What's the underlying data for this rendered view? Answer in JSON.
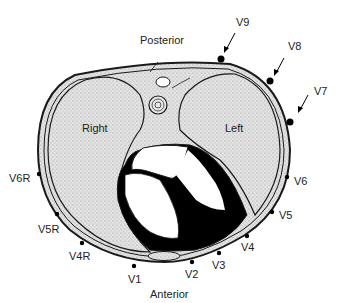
{
  "diagram": {
    "type": "cross-section",
    "orientation": {
      "top": "Posterior",
      "bottom": "Anterior"
    },
    "lungs": {
      "right": "Right",
      "left": "Left"
    },
    "leads": [
      {
        "id": "V1",
        "label": "V1"
      },
      {
        "id": "V2",
        "label": "V2"
      },
      {
        "id": "V3",
        "label": "V3"
      },
      {
        "id": "V4",
        "label": "V4"
      },
      {
        "id": "V5",
        "label": "V5"
      },
      {
        "id": "V6",
        "label": "V6"
      },
      {
        "id": "V7",
        "label": "V7"
      },
      {
        "id": "V8",
        "label": "V8"
      },
      {
        "id": "V9",
        "label": "V9"
      },
      {
        "id": "V4R",
        "label": "V4R"
      },
      {
        "id": "V5R",
        "label": "V5R"
      },
      {
        "id": "V6R",
        "label": "V6R"
      }
    ],
    "colors": {
      "outline": "#1a1a1a",
      "stipple": "#d4d4d4",
      "myocardium": "#000000",
      "background": "#ffffff"
    }
  }
}
